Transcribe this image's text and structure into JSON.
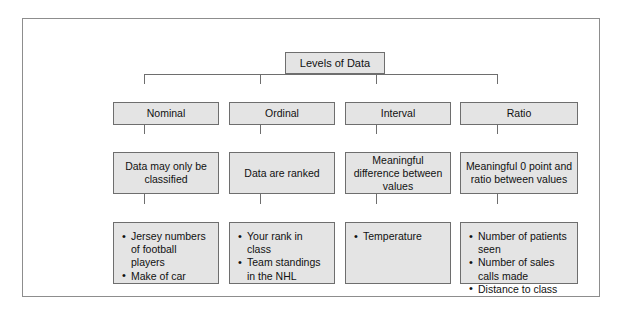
{
  "diagram": {
    "title": "Levels of Data",
    "columns": [
      {
        "header": "Nominal",
        "definition": "Data may only be classified",
        "examples": [
          "Jersey numbers of football players",
          "Make of car"
        ]
      },
      {
        "header": "Ordinal",
        "definition": "Data are ranked",
        "examples": [
          "Your rank in class",
          "Team standings in the NHL"
        ]
      },
      {
        "header": "Interval",
        "definition": "Meaningful difference between values",
        "examples": [
          "Temperature"
        ]
      },
      {
        "header": "Ratio",
        "definition": "Meaningful 0 point and ratio between values",
        "examples": [
          "Number of patients seen",
          "Number of sales calls made",
          "Distance to class"
        ]
      }
    ],
    "colors": {
      "box_fill": "#e4e4e4",
      "box_border": "#6e6e6e",
      "frame_border": "#8d8d8d",
      "text": "#111111",
      "background": "#ffffff"
    }
  }
}
